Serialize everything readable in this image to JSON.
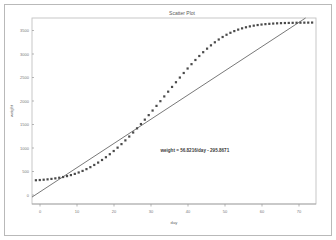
{
  "chart_data": {
    "type": "scatter",
    "title": "Scatter Plot",
    "xlabel": "day",
    "ylabel": "weight",
    "xlim": [
      0,
      73
    ],
    "ylim": [
      -450,
      3700
    ],
    "grid": false,
    "legend": null,
    "annotation": "weight = 56.8216/day - 295.8671",
    "x_ticks": [
      0,
      10,
      20,
      30,
      40,
      50,
      60,
      70
    ],
    "y_ticks": [
      0,
      500,
      1000,
      1500,
      2000,
      2500,
      3000,
      3500
    ],
    "x_tick_labels": [
      "0",
      "10",
      "20",
      "30",
      "40",
      "50",
      "60",
      "70"
    ],
    "y_tick_labels": [
      "0",
      "500",
      "1000",
      "1500",
      "2000",
      "2500",
      "3000",
      "3500"
    ],
    "series": [
      {
        "name": "weight",
        "type": "scatter",
        "marker": "square",
        "color": "#4a4a4a",
        "x": [
          1,
          2,
          3,
          4,
          5,
          6,
          7,
          8,
          9,
          10,
          11,
          12,
          13,
          14,
          15,
          16,
          17,
          18,
          19,
          20,
          21,
          22,
          23,
          24,
          25,
          26,
          27,
          28,
          29,
          30,
          31,
          32,
          33,
          34,
          35,
          36,
          37,
          38,
          39,
          40,
          41,
          42,
          43,
          44,
          45,
          46,
          47,
          48,
          49,
          50,
          51,
          52,
          53,
          54,
          55,
          56,
          57,
          58,
          59,
          60,
          61,
          62,
          63,
          64,
          65,
          66,
          67,
          68,
          69,
          70,
          71,
          72
        ],
        "y": [
          80,
          85,
          92,
          100,
          110,
          122,
          136,
          152,
          172,
          195,
          222,
          253,
          288,
          328,
          372,
          421,
          474,
          532,
          594,
          661,
          732,
          807,
          886,
          969,
          1055,
          1145,
          1238,
          1334,
          1432,
          1533,
          1635,
          1739,
          1844,
          1950,
          2056,
          2162,
          2267,
          2371,
          2473,
          2573,
          2670,
          2763,
          2852,
          2937,
          3016,
          3090,
          3158,
          3220,
          3276,
          3326,
          3370,
          3408,
          3441,
          3469,
          3493,
          3513,
          3529,
          3543,
          3554,
          3563,
          3570,
          3576,
          3581,
          3585,
          3588,
          3590,
          3592,
          3594,
          3595,
          3596,
          3597,
          3598
        ]
      },
      {
        "name": "regression line",
        "type": "line",
        "color": "#555555",
        "slope": 56.8216,
        "intercept": -295.8671,
        "x": [
          0,
          73
        ],
        "y": [
          -295.8671,
          3851.1097
        ]
      }
    ]
  },
  "annotation_position": {
    "x_value": 33,
    "y_value": 700
  }
}
